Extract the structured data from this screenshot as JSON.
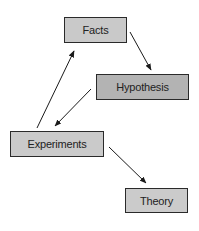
{
  "diagram": {
    "type": "flow-cycle",
    "nodes": [
      {
        "id": "facts",
        "label": "Facts",
        "x": 64,
        "y": 17,
        "w": 63,
        "h": 26,
        "fill": "#c9c9c9"
      },
      {
        "id": "hypothesis",
        "label": "Hypothesis",
        "x": 96,
        "y": 74,
        "w": 93,
        "h": 26,
        "fill": "#b3b3b3"
      },
      {
        "id": "experiments",
        "label": "Experiments",
        "x": 10,
        "y": 131,
        "w": 94,
        "h": 26,
        "fill": "#cacaca"
      },
      {
        "id": "theory",
        "label": "Theory",
        "x": 125,
        "y": 188,
        "w": 63,
        "h": 25,
        "fill": "#cbcbcb"
      }
    ],
    "edges": [
      {
        "from": "facts",
        "to": "hypothesis"
      },
      {
        "from": "hypothesis",
        "to": "experiments"
      },
      {
        "from": "experiments",
        "to": "facts"
      },
      {
        "from": "experiments",
        "to": "theory"
      }
    ],
    "colors": {
      "border": "#2a2a2a",
      "arrow": "#1a1a1a",
      "text": "#222222",
      "background": "#ffffff"
    }
  }
}
